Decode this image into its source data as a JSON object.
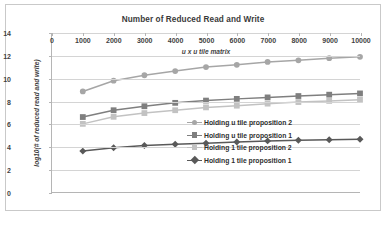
{
  "chart_data": {
    "type": "line",
    "title": "Number of Reduced Read and Write",
    "xlabel": "u x u tile matrix",
    "ylabel": "log10(# of reduced read and write)",
    "x": [
      1000,
      2000,
      3000,
      4000,
      5000,
      6000,
      7000,
      8000,
      9000,
      10000
    ],
    "xlim": [
      0,
      10000
    ],
    "ylim": [
      0,
      14
    ],
    "xticks": [
      "0",
      "1000",
      "2000",
      "3000",
      "4000",
      "5000",
      "6000",
      "7000",
      "8000",
      "9000",
      "10000"
    ],
    "yticks": [
      "0",
      "2",
      "4",
      "6",
      "8",
      "10",
      "12",
      "14"
    ],
    "grid": "horizontal",
    "legend_position": "inside-lower-right",
    "series": [
      {
        "name": "Holding u tile proposition 2",
        "color": "#a6a6a6",
        "marker": "circle",
        "values": [
          8.85,
          9.8,
          10.28,
          10.65,
          11.0,
          11.2,
          11.45,
          11.6,
          11.78,
          11.9
        ]
      },
      {
        "name": "Holding u tile proposition 1",
        "color": "#7f7f7f",
        "marker": "square",
        "values": [
          6.6,
          7.2,
          7.55,
          7.85,
          8.05,
          8.2,
          8.33,
          8.45,
          8.57,
          8.68
        ]
      },
      {
        "name": "Holding 1 tile proposition 2",
        "color": "#c2c2c2",
        "marker": "square",
        "values": [
          6.0,
          6.62,
          6.95,
          7.2,
          7.45,
          7.6,
          7.78,
          7.92,
          8.02,
          8.12
        ]
      },
      {
        "name": "Holding 1 tile  proposition 1",
        "color": "#595959",
        "marker": "diamond",
        "values": [
          3.6,
          3.9,
          4.1,
          4.2,
          4.3,
          4.4,
          4.5,
          4.55,
          4.6,
          4.65
        ]
      }
    ]
  }
}
